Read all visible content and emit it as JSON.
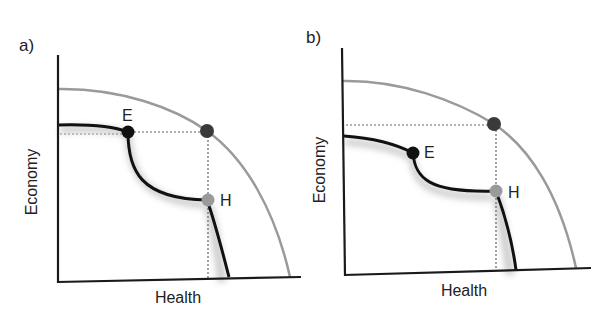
{
  "figure": {
    "panels": [
      {
        "id": "a",
        "label": "a)",
        "x_axis_label": "Health",
        "y_axis_label": "Economy",
        "points": {
          "E": {
            "label": "E",
            "color": "#111111"
          },
          "H": {
            "label": "H",
            "color": "#9a9a9a"
          },
          "frontier_point": {
            "label": "",
            "color": "#333333"
          }
        }
      },
      {
        "id": "b",
        "label": "b)",
        "x_axis_label": "Health",
        "y_axis_label": "Economy",
        "points": {
          "E": {
            "label": "E",
            "color": "#111111"
          },
          "H": {
            "label": "H",
            "color": "#9a9a9a"
          },
          "frontier_point": {
            "label": "",
            "color": "#333333"
          }
        }
      }
    ],
    "colors": {
      "axis": "#1a1a1a",
      "outer_frontier": "#9a9a9a",
      "inner_curve": "#111111",
      "dotted_guides": "#666666",
      "shadow": "#bdbdbd"
    }
  }
}
